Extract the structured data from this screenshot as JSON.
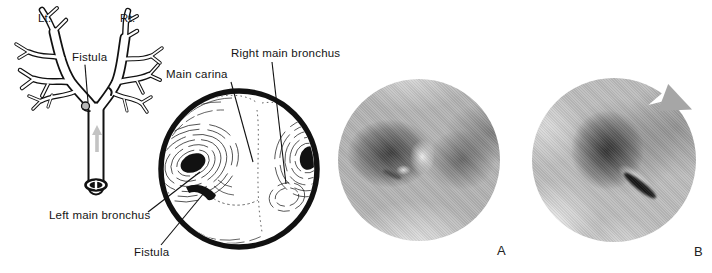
{
  "figure": {
    "background_color": "#ffffff",
    "ink_color": "#111111",
    "tree_panel": {
      "left_label": "Lt.",
      "right_label": "Rt.",
      "fistula_label": "Fistula"
    },
    "illustration_panel": {
      "main_carina_label": "Main carina",
      "right_main_bronchus_label": "Right main bronchus",
      "left_main_bronchus_label": "Left main bronchus",
      "fistula_label": "Fistula"
    },
    "photo_panels": [
      {
        "label": "A",
        "base_gray": "#b4b4b4"
      },
      {
        "label": "B",
        "base_gray": "#bdbdbd"
      }
    ]
  }
}
